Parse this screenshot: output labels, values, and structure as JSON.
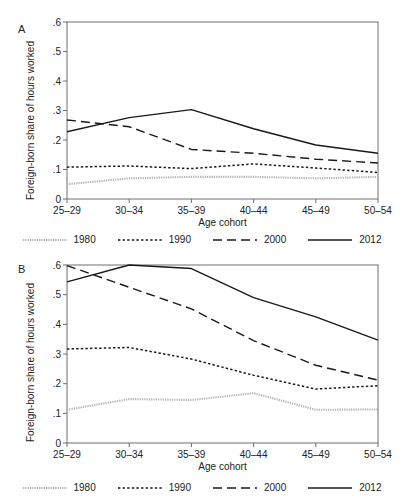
{
  "figure": {
    "panels": [
      {
        "letter": "A",
        "ylabel": "Foreign-born share of hours worked",
        "xlabel": "Age cohort"
      },
      {
        "letter": "B",
        "ylabel": "Foreign-born share of hours worked",
        "xlabel": "Age cohort"
      }
    ],
    "legend": [
      {
        "label": "1980",
        "style": "dense-dotted-gray",
        "color": "#b0b0b0"
      },
      {
        "label": "1990",
        "style": "dotted",
        "color": "#1a1a1a"
      },
      {
        "label": "2000",
        "style": "long-dash",
        "color": "#1a1a1a"
      },
      {
        "label": "2012",
        "style": "solid",
        "color": "#1a1a1a"
      }
    ]
  },
  "chart_data": [
    {
      "type": "line",
      "panel": "A",
      "title": "",
      "xlabel": "Age cohort",
      "ylabel": "Foreign-born share of hours worked",
      "categories": [
        "25–29",
        "30–34",
        "35–39",
        "40–44",
        "45–49",
        "50–54"
      ],
      "yticks": [
        "0",
        ".1",
        ".2",
        ".3",
        ".4",
        ".5",
        ".6"
      ],
      "ytickvals": [
        0,
        0.1,
        0.2,
        0.3,
        0.4,
        0.5,
        0.6
      ],
      "ylim": [
        0,
        0.6
      ],
      "grid": false,
      "legend_position": "bottom",
      "series": [
        {
          "name": "1980",
          "values": [
            0.05,
            0.07,
            0.075,
            0.075,
            0.07,
            0.075
          ],
          "style": "dense-dotted-gray",
          "color": "#b0b0b0"
        },
        {
          "name": "1990",
          "values": [
            0.108,
            0.112,
            0.103,
            0.119,
            0.105,
            0.09
          ],
          "style": "dotted",
          "color": "#1a1a1a"
        },
        {
          "name": "2000",
          "values": [
            0.268,
            0.245,
            0.168,
            0.155,
            0.135,
            0.122
          ],
          "style": "long-dash",
          "color": "#1a1a1a"
        },
        {
          "name": "2012",
          "values": [
            0.228,
            0.276,
            0.303,
            0.238,
            0.183,
            0.155
          ],
          "style": "solid",
          "color": "#1a1a1a"
        }
      ]
    },
    {
      "type": "line",
      "panel": "B",
      "title": "",
      "xlabel": "Age cohort",
      "ylabel": "Foreign-born share of hours worked",
      "categories": [
        "25–29",
        "30–34",
        "35–39",
        "40–44",
        "45–49",
        "50–54"
      ],
      "yticks": [
        "0",
        ".1",
        ".2",
        ".3",
        ".4",
        ".5",
        ".6"
      ],
      "ytickvals": [
        0,
        0.1,
        0.2,
        0.3,
        0.4,
        0.5,
        0.6
      ],
      "ylim": [
        0,
        0.6
      ],
      "grid": false,
      "legend_position": "bottom",
      "series": [
        {
          "name": "1980",
          "values": [
            0.112,
            0.148,
            0.145,
            0.168,
            0.112,
            0.113
          ],
          "style": "dense-dotted-gray",
          "color": "#b0b0b0"
        },
        {
          "name": "1990",
          "values": [
            0.317,
            0.322,
            0.283,
            0.228,
            0.182,
            0.193
          ],
          "style": "dotted",
          "color": "#1a1a1a"
        },
        {
          "name": "2000",
          "values": [
            0.598,
            0.525,
            0.452,
            0.345,
            0.262,
            0.212
          ],
          "style": "long-dash",
          "color": "#1a1a1a"
        },
        {
          "name": "2012",
          "values": [
            0.543,
            0.6,
            0.588,
            0.49,
            0.425,
            0.347
          ],
          "style": "solid",
          "color": "#1a1a1a"
        }
      ]
    }
  ]
}
